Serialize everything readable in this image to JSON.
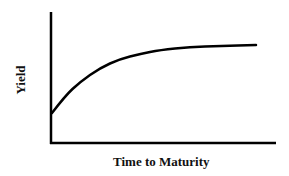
{
  "chart_data": {
    "type": "line",
    "title": "",
    "xlabel": "Time to Maturity",
    "ylabel": "Yield",
    "grid": false,
    "legend": null,
    "ticks": {
      "x": [],
      "y": []
    },
    "series": [
      {
        "name": "Yield curve",
        "shape": "upward-sloping, concave (normal yield curve)",
        "points_px": [
          [
            52,
            113
          ],
          [
            65,
            96
          ],
          [
            80,
            82
          ],
          [
            100,
            68
          ],
          [
            120,
            59
          ],
          [
            140,
            54
          ],
          [
            160,
            50
          ],
          [
            190,
            47
          ],
          [
            220,
            46
          ],
          [
            256,
            45
          ]
        ],
        "color": "#000000"
      }
    ]
  }
}
